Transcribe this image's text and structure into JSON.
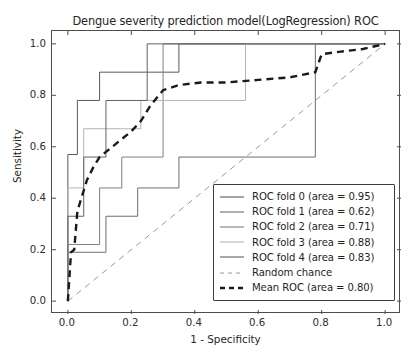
{
  "chart_data": {
    "type": "line",
    "title": "Dengue severity prediction model(LogRegression) ROC",
    "xlabel": "1 - Specificity",
    "ylabel": "Sensitivity",
    "xlim": [
      -0.05,
      1.05
    ],
    "ylim": [
      -0.05,
      1.05
    ],
    "xticks": [
      "0.0",
      "0.2",
      "0.4",
      "0.6",
      "0.8",
      "1.0"
    ],
    "xtick_values": [
      0.0,
      0.2,
      0.4,
      0.6,
      0.8,
      1.0
    ],
    "yticks": [
      "0.0",
      "0.2",
      "0.4",
      "0.6",
      "0.8",
      "1.0"
    ],
    "ytick_values": [
      0.0,
      0.2,
      0.4,
      0.6,
      0.8,
      1.0
    ],
    "grid": false,
    "legend_position": "lower right",
    "series": [
      {
        "name": "ROC fold 0 (area = 0.95)",
        "label_prefix": "ROC fold 0",
        "area": 0.95,
        "color": "#5a5a5a",
        "style": "solid",
        "width": 1.0,
        "x": [
          0.0,
          0.0,
          0.03,
          0.03,
          0.1,
          0.1,
          0.35,
          0.35,
          1.0
        ],
        "y": [
          0.0,
          0.57,
          0.57,
          0.78,
          0.78,
          0.89,
          0.89,
          1.0,
          1.0
        ]
      },
      {
        "name": "ROC fold 1 (area = 0.62)",
        "label_prefix": "ROC fold 1",
        "area": 0.62,
        "color": "#6e6e6e",
        "style": "solid",
        "width": 1.0,
        "x": [
          0.0,
          0.0,
          0.12,
          0.12,
          0.22,
          0.22,
          0.35,
          0.35,
          0.78,
          0.78,
          1.0
        ],
        "y": [
          0.0,
          0.19,
          0.19,
          0.33,
          0.33,
          0.44,
          0.44,
          0.56,
          0.56,
          1.0,
          1.0
        ]
      },
      {
        "name": "ROC fold 2 (area = 0.71)",
        "label_prefix": "ROC fold 2",
        "area": 0.71,
        "color": "#808080",
        "style": "solid",
        "width": 1.0,
        "x": [
          0.0,
          0.0,
          0.1,
          0.1,
          0.17,
          0.17,
          0.3,
          0.3,
          1.0
        ],
        "y": [
          0.0,
          0.22,
          0.22,
          0.44,
          0.44,
          0.56,
          0.56,
          1.0,
          1.0
        ]
      },
      {
        "name": "ROC fold 3 (area = 0.88)",
        "label_prefix": "ROC fold 3",
        "area": 0.88,
        "color": "#b4b4b4",
        "style": "solid",
        "width": 1.0,
        "x": [
          0.0,
          0.0,
          0.05,
          0.05,
          0.23,
          0.23,
          0.56,
          0.56,
          1.0
        ],
        "y": [
          0.0,
          0.44,
          0.44,
          0.67,
          0.67,
          0.78,
          0.78,
          1.0,
          1.0
        ]
      },
      {
        "name": "ROC fold 4 (area = 0.83)",
        "label_prefix": "ROC fold 4",
        "area": 0.83,
        "color": "#626262",
        "style": "solid",
        "width": 1.0,
        "x": [
          0.0,
          0.0,
          0.05,
          0.05,
          0.12,
          0.12,
          0.25,
          0.25,
          1.0
        ],
        "y": [
          0.0,
          0.33,
          0.33,
          0.56,
          0.56,
          0.78,
          0.78,
          1.0,
          1.0
        ]
      },
      {
        "name": "Random chance",
        "label_prefix": "Random chance",
        "area": null,
        "color": "#9a9a9a",
        "style": "dashed",
        "width": 1.0,
        "x": [
          0.0,
          1.0
        ],
        "y": [
          0.0,
          1.0
        ]
      },
      {
        "name": "Mean ROC (area = 0.80)",
        "label_prefix": "Mean ROC",
        "area": 0.8,
        "color": "#1a1a1a",
        "style": "dashed",
        "width": 2.4,
        "x": [
          0.0,
          0.01,
          0.02,
          0.03,
          0.05,
          0.06,
          0.08,
          0.1,
          0.12,
          0.14,
          0.17,
          0.2,
          0.23,
          0.26,
          0.3,
          0.35,
          0.42,
          0.5,
          0.6,
          0.7,
          0.78,
          0.8,
          0.86,
          0.93,
          1.0
        ],
        "y": [
          0.0,
          0.19,
          0.2,
          0.35,
          0.43,
          0.47,
          0.52,
          0.56,
          0.58,
          0.6,
          0.63,
          0.66,
          0.7,
          0.76,
          0.82,
          0.84,
          0.85,
          0.85,
          0.86,
          0.87,
          0.89,
          0.96,
          0.97,
          0.98,
          1.0
        ]
      }
    ]
  }
}
